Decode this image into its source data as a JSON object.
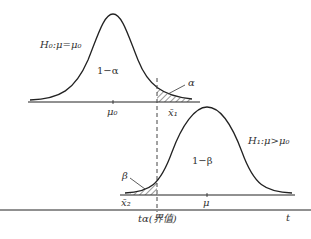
{
  "diagram": {
    "h0_label": "H₀:μ=μ₀",
    "h1_label": "H₁:μ>μ₀",
    "one_minus_alpha": "1−α",
    "one_minus_beta": "1−β",
    "alpha": "α",
    "beta": "β",
    "mu0": "μ₀",
    "mu": "μ",
    "x1": "x̄₁",
    "x2": "x̄₂",
    "critical": "tα(界值)",
    "axis_t": "t",
    "colors": {
      "line": "#222222",
      "text": "#333333",
      "background": "#ffffff"
    }
  }
}
